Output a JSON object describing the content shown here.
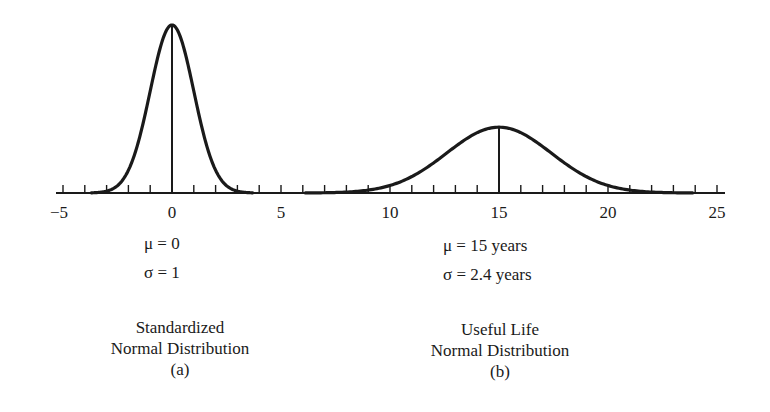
{
  "chart_data": {
    "type": "line",
    "title": "",
    "xlabel": "",
    "ylabel": "",
    "axis": {
      "xlim": [
        -5,
        25
      ],
      "major_ticks": [
        -5,
        0,
        5,
        10,
        15,
        20,
        25
      ],
      "minor_tick_step": 1,
      "grid": false
    },
    "series": [
      {
        "name": "Standardized Normal Distribution",
        "label": "(a)",
        "mean": 0,
        "std": 1,
        "mean_line": true,
        "params_text": [
          "μ = 0",
          "σ = 1"
        ]
      },
      {
        "name": "Useful Life Normal Distribution",
        "label": "(b)",
        "mean": 15,
        "std": 2.4,
        "mean_line": true,
        "params_text": [
          "μ = 15 years",
          "σ = 2.4 years"
        ]
      }
    ]
  },
  "labels": {
    "a": {
      "mu": "μ = 0",
      "sigma": "σ = 1",
      "title_line1": "Standardized",
      "title_line2": "Normal Distribution",
      "tag": "(a)"
    },
    "b": {
      "mu": "μ = 15 years",
      "sigma": "σ = 2.4 years",
      "title_line1": "Useful Life",
      "title_line2": "Normal Distribution",
      "tag": "(b)"
    }
  },
  "colors": {
    "ink": "#1a1a1a",
    "background": "#ffffff"
  }
}
